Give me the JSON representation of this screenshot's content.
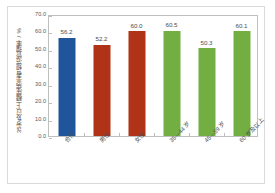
{
  "chart_data": {
    "type": "bar",
    "title": "",
    "subtitle": "",
    "xlabel": "",
    "ylabel": "35岁及以上糖尿病患者规范管理率 / %",
    "ylim": [
      0,
      70
    ],
    "y_ticks": [
      "0.0",
      "10.0",
      "20.0",
      "30.0",
      "40.0",
      "50.0",
      "60.0",
      "70.0"
    ],
    "y_tick_values": [
      0,
      10,
      20,
      30,
      40,
      50,
      60,
      70
    ],
    "grid": false,
    "legend": "none",
    "categories": [
      "合计",
      "男性",
      "女性",
      "35—44 岁",
      "45—59 岁",
      "60 岁及以上"
    ],
    "values": [
      56.2,
      52.2,
      60.0,
      60.5,
      50.3,
      60.1
    ],
    "value_labels": [
      "56.2",
      "52.2",
      "60.0",
      "60.5",
      "50.3",
      "60.1"
    ],
    "bar_colors": [
      "#21559B",
      "#B03317",
      "#B03317",
      "#72AE42",
      "#72AE42",
      "#72AE42"
    ],
    "colors": {
      "blue": "#21559B",
      "red": "#B03317",
      "green": "#72AE42",
      "axis": "#bfbfbf",
      "frame": "#d9d9d9",
      "text": "#4d4d4d",
      "background": "#ffffff"
    }
  }
}
